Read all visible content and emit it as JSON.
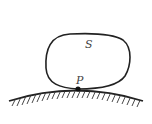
{
  "diagram": {
    "labels": {
      "surface_region": "S",
      "contact_point": "P"
    },
    "colors": {
      "stroke": "#222222",
      "label": "#444444",
      "background": "#ffffff"
    }
  }
}
